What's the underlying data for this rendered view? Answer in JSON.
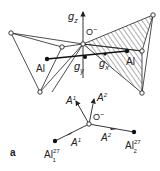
{
  "figure": {
    "panel_label": "a",
    "top": {
      "axis_z": "g",
      "axis_z_sub": "z",
      "axis_y": "g",
      "axis_y_sub": "y",
      "axis_x": "g",
      "axis_x_sub": "x",
      "center_label": "O",
      "center_charge": "−",
      "al_left": "Al",
      "al_right": "Al"
    },
    "bottom": {
      "center_label": "O",
      "center_charge": "−",
      "vec1": "A",
      "vec1_sup": "1",
      "vec2": "A",
      "vec2_sup": "2",
      "bond1": "A",
      "bond1_sup": "1",
      "bond2": "A",
      "bond2_sup": "2",
      "al1": "Al",
      "al1_sup": "27",
      "al1_sub": "1",
      "al2": "Al",
      "al2_sup": "27",
      "al2_sub": "2"
    }
  }
}
